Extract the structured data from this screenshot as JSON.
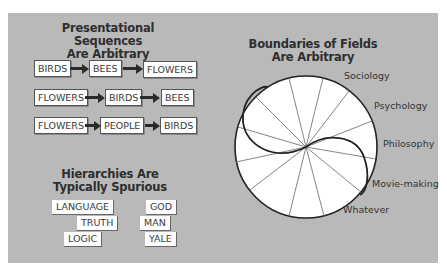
{
  "left_top": {
    "title_line1": "Presentational Sequences",
    "title_line2": "Are Arbitrary",
    "sequences": [
      [
        "BIRDS",
        "BEES",
        "FLOWERS"
      ],
      [
        "FLOWERS",
        "BIRDS",
        "BEES"
      ],
      [
        "FLOWERS",
        "PEOPLE",
        "BIRDS"
      ]
    ]
  },
  "left_bottom": {
    "title_line1": "Hierarchies Are",
    "title_line2": "Typically Spurious",
    "column1": [
      "LANGUAGE",
      "TRUTH",
      "LOGIC"
    ],
    "column2": [
      "GOD",
      "MAN",
      "YALE"
    ]
  },
  "right": {
    "title_line1": "Boundaries of Fields",
    "title_line2": "Are Arbitrary",
    "fields": [
      "Sociology",
      "Psychology",
      "Philosophy",
      "Movie-making",
      "Whatever"
    ]
  },
  "colors": {
    "panel_bg": "#b9b9b9",
    "box_bg": "#ffffff",
    "text": "#2e2e2e"
  }
}
